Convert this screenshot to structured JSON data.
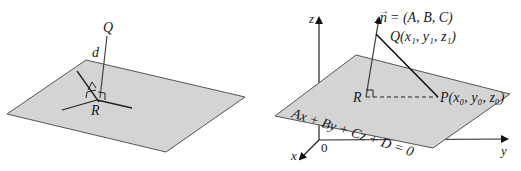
{
  "left_figure": {
    "point_top": "Q",
    "point_foot": "R",
    "distance_label": "d",
    "plane_fill": "#d4d4d4",
    "plane_stroke": "#555555"
  },
  "right_figure": {
    "axes": {
      "z": "z",
      "y": "y",
      "x": "x",
      "origin": "0"
    },
    "normal_vector": {
      "symbol": "n",
      "arrow": "→",
      "equals": "= (A, B, C)"
    },
    "point_Q": "Q(x₁, y₁, z₁)",
    "point_R": "R",
    "point_P": "P(x₀, y₀, z₀)",
    "plane_equation": "Ax + By + Cz + D = 0",
    "plane_fill": "#d4d4d4",
    "plane_stroke": "#555555"
  }
}
